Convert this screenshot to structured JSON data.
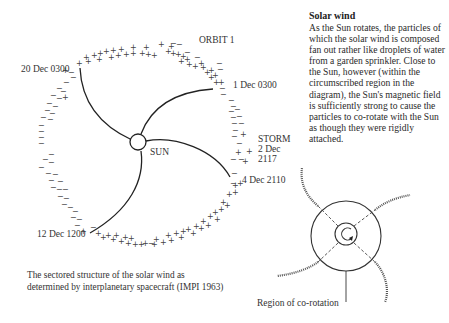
{
  "diagram": {
    "main": {
      "center_label": "SUN",
      "labels": {
        "orbit": "ORBIT 1",
        "d1": "1 Dec 0300",
        "storm": "STORM",
        "storm_date": "2 Dec",
        "storm_time": "2117",
        "d4": "4 Dec 2110",
        "d12": "12 Dec 1200",
        "d20": "20 Dec 0300"
      },
      "caption_line1": "The sectored structure of the solar wind as",
      "caption_line2": "determined by interplanetary spacecraft (IMPI 1963)",
      "sector_markers": {
        "positive": "+",
        "negative": "−"
      }
    },
    "sidebar": {
      "title": "Solar wind",
      "body": "As the Sun rotates, the particles of which the solar wind is composed fan out rather like droplets of water from a garden sprinkler. Close to the Sun, however (within the circumscribed region in the diagram), the Sun's magnetic field is sufficiently strong to cause the particles to co-rotate with the Sun as though they were rigidly attached."
    },
    "inset": {
      "label": "Region of co-rotation"
    }
  }
}
